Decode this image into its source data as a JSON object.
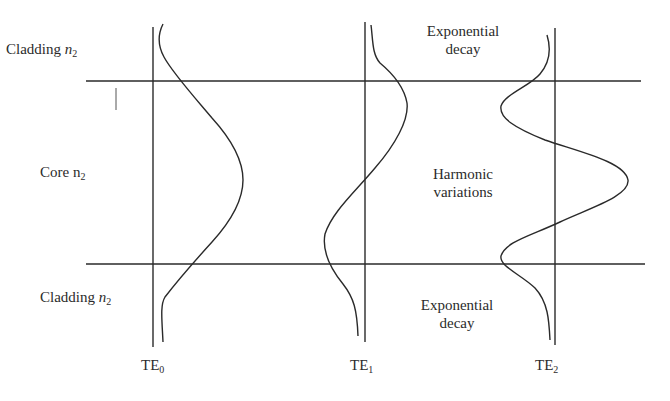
{
  "regions": {
    "top_cladding": {
      "label": "Cladding",
      "symbol": "n",
      "subscript": "2"
    },
    "core": {
      "label": "Core",
      "symbol": "n",
      "subscript": "2"
    },
    "bottom_cladding": {
      "label": "Cladding",
      "symbol": "n",
      "subscript": "2"
    }
  },
  "annotations": {
    "top": {
      "line1": "Exponential",
      "line2": "decay"
    },
    "middle": {
      "line1": "Harmonic",
      "line2": "variations"
    },
    "bottom": {
      "line1": "Exponential",
      "line2": "decay"
    }
  },
  "modes": [
    {
      "name": "TE",
      "subscript": "0"
    },
    {
      "name": "TE",
      "subscript": "1"
    },
    {
      "name": "TE",
      "subscript": "2"
    }
  ],
  "colors": {
    "line": "#2a2a2a",
    "background": "#ffffff"
  }
}
